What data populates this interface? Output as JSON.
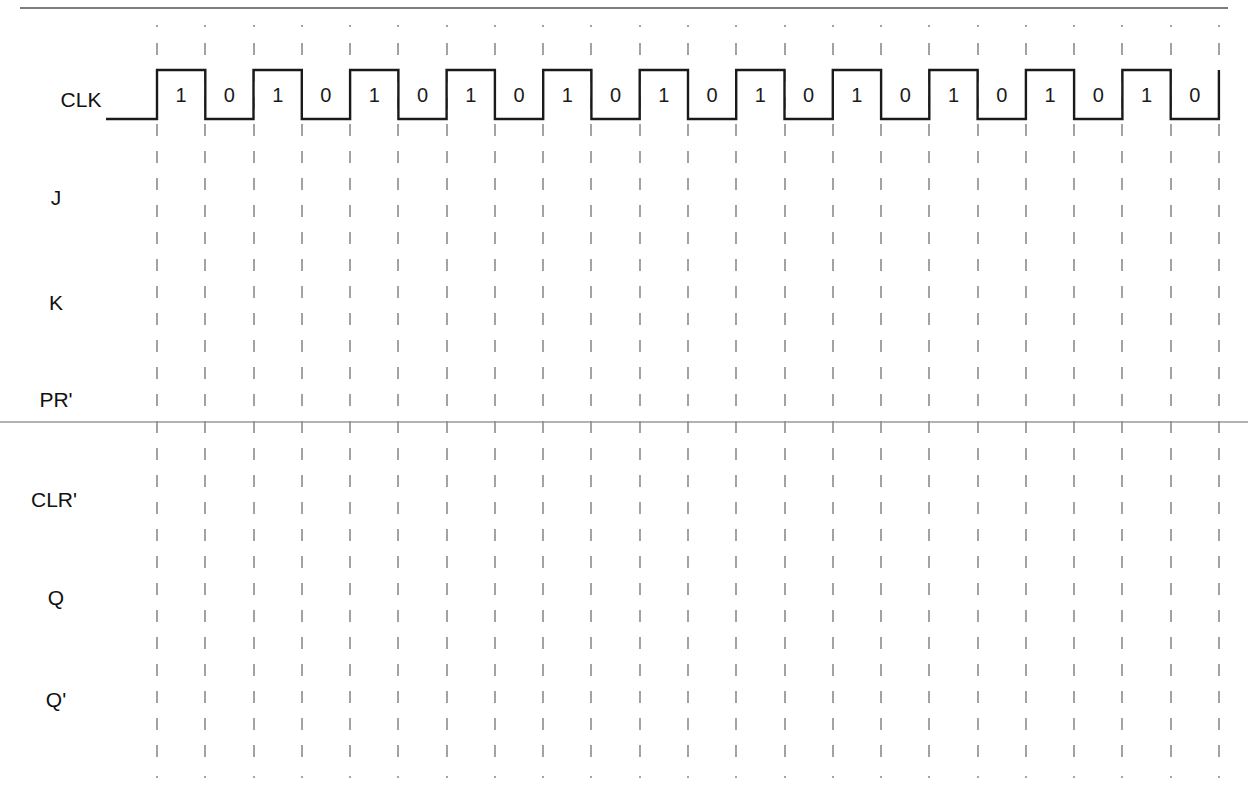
{
  "diagram": {
    "type": "timing-diagram",
    "signals": [
      {
        "name": "CLK",
        "y": 100
      },
      {
        "name": "J",
        "y": 198
      },
      {
        "name": "K",
        "y": 302
      },
      {
        "name": "PR'",
        "y": 400
      },
      {
        "name": "CLR'",
        "y": 500
      },
      {
        "name": "Q",
        "y": 598
      },
      {
        "name": "Q'",
        "y": 700
      }
    ],
    "clock": {
      "cycles": 11,
      "half_period_labels": [
        "1",
        "0",
        "1",
        "0",
        "1",
        "0",
        "1",
        "0",
        "1",
        "0",
        "1",
        "0",
        "1",
        "0",
        "1",
        "0",
        "1",
        "0",
        "1",
        "0",
        "1",
        "0"
      ],
      "start_x": 106,
      "first_edge_x": 157,
      "half_period_px": 48.27,
      "high_y": 70,
      "low_y": 119
    },
    "gridlines": {
      "count": 23,
      "style": "dashed",
      "color": "#8c8c8c",
      "top_y": 25,
      "bottom_y": 778
    },
    "rules": [
      {
        "y": 8,
        "x1": 20,
        "x2": 1228,
        "color": "#555555"
      },
      {
        "y": 422,
        "x1": 0,
        "x2": 1248,
        "color": "#9a9a9a"
      }
    ],
    "colors": {
      "waveform": "#1a1a1a",
      "text": "#111111",
      "background": "#ffffff"
    }
  }
}
